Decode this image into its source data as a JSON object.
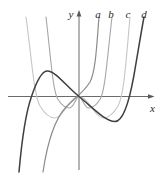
{
  "figure": {
    "width": 161,
    "height": 175,
    "background": "#ffffff",
    "axes": {
      "color": "#5a5a5a",
      "stroke_width": 0.9,
      "origin_px": {
        "x": 79,
        "y": 96.5
      },
      "x_axis": {
        "from": 8,
        "to": 150,
        "label": "x",
        "label_x": 152.5,
        "label_y": 112,
        "arrow": "154.5,96.5 148,94.2 148,98.8"
      },
      "y_axis": {
        "from": 15,
        "to": 170,
        "label": "y",
        "label_x": 71,
        "label_y": 18,
        "arrow": "79,10 76.6,16.5 81.4,16.5"
      },
      "label_color": "#2b2b2b",
      "label_font_size": 11
    },
    "curve_labels": [
      {
        "text": "a",
        "x": 98,
        "y": 17.5
      },
      {
        "text": "b",
        "x": 111,
        "y": 17.5
      },
      {
        "text": "c",
        "x": 128,
        "y": 17.5
      },
      {
        "text": "d",
        "x": 144,
        "y": 17.5
      }
    ],
    "curves": [
      {
        "name": "c",
        "color": "#c6c6c6",
        "width": 1.1,
        "path": "M 26,17 C 32,62 34,95 40,106 C 45,114.5 50,118 55,118 C 63,118 70,96.5 79,96.5 C 88,96.5 95,118 103,118 C 108,118 113,114.5 118,106 C 124,95 126,62 130,17"
      },
      {
        "name": "b",
        "color": "#a6a6a6",
        "width": 1.1,
        "path": "M 46,17 C 51,60 53,92 58,99.5 C 62,105.5 66,108 69,108 C 74,108 76,96.5 79,96.5 C 82,96.5 84,108 89,108 C 92,108 96,105.5 100,99.5 C 105,92 107,60 112,17"
      },
      {
        "name": "a",
        "color": "#8c8c8c",
        "width": 1.2,
        "path": "M 43,172 C 47,145 54,120 66,107 C 74,99 84,92 90,82 C 96,71 97,40 99,17"
      },
      {
        "name": "d",
        "color": "#3f3f3f",
        "width": 1.5,
        "path": "M 19,172 C 22,138 26,112 31.5,96.5 C 36,83 41,71.5 47,71 C 55,70.5 66,86 79,96.5 C 92,107 105,121.5 115,121.5 C 123,121.5 129,103 134,75 C 138,52 141,33 144,17"
      }
    ]
  },
  "chart_data": {
    "type": "line",
    "title": "",
    "xlabel": "x",
    "ylabel": "y",
    "grid": false,
    "axis_numeric_labels": false,
    "legend_position": "labels above curve tops (top right): a b c d",
    "note": "Four grayscale function graphs on unlabeled axes; points sampled in image pixel coordinates (y increases downward), origin of axes at (79, 96.5).",
    "series": [
      {
        "name": "a",
        "shape": "odd S-shaped curve through the origin, steep near origin (cubic-like)",
        "points_px": [
          [
            43,
            172
          ],
          [
            50,
            130
          ],
          [
            60,
            114
          ],
          [
            66,
            107
          ],
          [
            79,
            96.5
          ],
          [
            90,
            82
          ],
          [
            96,
            45
          ],
          [
            99,
            17
          ]
        ]
      },
      {
        "name": "b",
        "shape": "W-shaped curve with local maximum touching the origin, shallow minima below x-axis (quartic-like)",
        "points_px": [
          [
            46,
            17
          ],
          [
            54,
            70
          ],
          [
            58,
            99.5
          ],
          [
            69,
            108
          ],
          [
            79,
            96.5
          ],
          [
            89,
            108
          ],
          [
            100,
            99.5
          ],
          [
            104,
            96.5
          ],
          [
            112,
            17
          ]
        ]
      },
      {
        "name": "c",
        "shape": "wider, deeper W-shaped curve with local maximum touching the origin (quartic-like)",
        "points_px": [
          [
            26,
            17
          ],
          [
            34,
            70
          ],
          [
            40,
            106
          ],
          [
            55,
            118
          ],
          [
            79,
            96.5
          ],
          [
            103,
            118
          ],
          [
            118,
            106
          ],
          [
            124,
            95
          ],
          [
            130,
            17
          ]
        ]
      },
      {
        "name": "d",
        "shape": "dark cubic-like curve: rises from lower left, local maximum left of origin, passes through origin, local minimum right of origin, rises steeply at right",
        "points_px": [
          [
            19,
            172
          ],
          [
            31.5,
            96.5
          ],
          [
            47,
            71
          ],
          [
            79,
            96.5
          ],
          [
            115,
            121.5
          ],
          [
            128,
            96.5
          ],
          [
            138,
            52
          ],
          [
            144,
            17
          ]
        ]
      }
    ]
  }
}
